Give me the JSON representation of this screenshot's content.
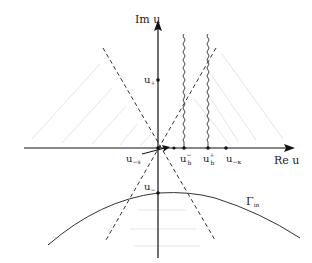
{
  "axes": {
    "x_label": "Re u",
    "y_label": "Im u"
  },
  "points": [
    {
      "id": "u_plus",
      "label": "u₊",
      "x": 158,
      "y": 80
    },
    {
      "id": "u_minus",
      "label": "u₋",
      "x": 158,
      "y": 192
    },
    {
      "id": "u_minus_s",
      "label": "u₋ₛ",
      "x": 158,
      "y": 148
    },
    {
      "id": "u_b_minus",
      "label": "u_b⁻",
      "x": 185,
      "y": 148
    },
    {
      "id": "u_b_plus",
      "label": "u_b⁺",
      "x": 207,
      "y": 148
    },
    {
      "id": "u_minus_kappa",
      "label": "u₋ₖ",
      "x": 226,
      "y": 148
    }
  ],
  "labels": {
    "u_plus": "u",
    "u_plus_sub": "+",
    "u_minus": "u",
    "u_minus_sub": "−",
    "u_minus_s": "u",
    "u_minus_s_sub": "−s",
    "u_b_minus": "u",
    "u_b_minus_sub": "b",
    "u_b_minus_sup": "−",
    "u_b_plus": "u",
    "u_b_plus_sub": "b",
    "u_b_plus_sup": "+",
    "u_minus_kappa": "u",
    "u_minus_kappa_sub": "−κ",
    "gamma": "Γ",
    "gamma_sub": "in"
  },
  "branch_cuts": [
    "from u_b⁻ upward",
    "from u_b⁺ upward"
  ],
  "contour": "Γ_in"
}
